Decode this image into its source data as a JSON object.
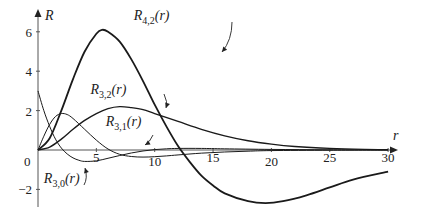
{
  "chart_data": {
    "type": "line",
    "title": "",
    "xlabel": "r",
    "ylabel": "R",
    "xlim": [
      0,
      30
    ],
    "ylim": [
      -3,
      6.5
    ],
    "grid": false,
    "x_ticks": [
      "5",
      "10",
      "15",
      "20",
      "25",
      "30"
    ],
    "y_ticks": [
      "6",
      "4",
      "2",
      "0",
      "-2"
    ],
    "origin_label": "0",
    "series": [
      {
        "name": "R4,2(r)",
        "label_main": "R",
        "label_sub": "4,2",
        "label_arg": "(r)",
        "weight": "heavy",
        "x": [
          0,
          1,
          2,
          3,
          4,
          5,
          5.5,
          6,
          7,
          8,
          9,
          10,
          11,
          12,
          13,
          14,
          15,
          16,
          18,
          19.5,
          21,
          23,
          25,
          27,
          30
        ],
        "y": [
          0,
          0.6,
          2.0,
          3.6,
          5.0,
          5.9,
          6.1,
          6.0,
          5.5,
          4.6,
          3.5,
          2.3,
          1.2,
          0.2,
          -0.6,
          -1.3,
          -1.8,
          -2.2,
          -2.6,
          -2.7,
          -2.6,
          -2.3,
          -1.9,
          -1.5,
          -1.1
        ]
      },
      {
        "name": "R3,2(r)",
        "label_main": "R",
        "label_sub": "3,2",
        "label_arg": "(r)",
        "weight": "medium",
        "x": [
          0,
          1,
          2,
          3,
          4,
          5,
          6,
          7,
          8,
          9,
          10,
          12,
          14,
          16,
          18,
          20,
          22,
          25,
          28,
          30
        ],
        "y": [
          0,
          0.15,
          0.55,
          1.05,
          1.5,
          1.85,
          2.1,
          2.2,
          2.15,
          2.05,
          1.85,
          1.45,
          1.05,
          0.72,
          0.47,
          0.3,
          0.18,
          0.08,
          0.03,
          0.02
        ]
      },
      {
        "name": "R3,1(r)",
        "label_main": "R",
        "label_sub": "3,1",
        "label_arg": "(r)",
        "weight": "light",
        "x": [
          0,
          0.5,
          1,
          1.5,
          2,
          2.5,
          3,
          4,
          5,
          6,
          7,
          8,
          9,
          10,
          11,
          12,
          14,
          16,
          18,
          20,
          25,
          30
        ],
        "y": [
          0,
          0.7,
          1.3,
          1.7,
          1.85,
          1.8,
          1.6,
          1.05,
          0.5,
          0.05,
          -0.22,
          -0.33,
          -0.36,
          -0.34,
          -0.3,
          -0.25,
          -0.16,
          -0.1,
          -0.06,
          -0.03,
          -0.01,
          0
        ]
      },
      {
        "name": "R3,0(r)",
        "label_main": "R",
        "label_sub": "3,0",
        "label_arg": "(r)",
        "weight": "light",
        "x": [
          0,
          0.5,
          1,
          1.5,
          2,
          2.5,
          3,
          3.5,
          4,
          5,
          6,
          7,
          8,
          9,
          10,
          11,
          12,
          14,
          16,
          20,
          25,
          30
        ],
        "y": [
          3.0,
          2.0,
          1.2,
          0.55,
          0.1,
          -0.2,
          -0.4,
          -0.52,
          -0.58,
          -0.55,
          -0.42,
          -0.28,
          -0.15,
          -0.05,
          0.02,
          0.06,
          0.08,
          0.08,
          0.06,
          0.03,
          0.01,
          0
        ]
      }
    ],
    "annotations": [
      {
        "text": "R4,2(r)",
        "x": 8.2,
        "y": 6.6
      },
      {
        "text": "R3,2(r)",
        "x": 4.5,
        "y": 2.85
      },
      {
        "text": "R3,1(r)",
        "x": 5.8,
        "y": 1.2
      },
      {
        "text": "R3,0(r)",
        "x": 0.5,
        "y": -1.7
      }
    ]
  }
}
